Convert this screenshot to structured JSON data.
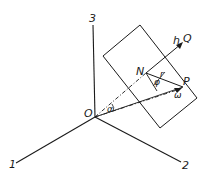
{
  "diagram": {
    "axes": [
      {
        "id": "axis-1",
        "label": "1"
      },
      {
        "id": "axis-2",
        "label": "2"
      },
      {
        "id": "axis-3",
        "label": "3"
      }
    ],
    "points": {
      "origin": "O",
      "N": "N",
      "P": "P",
      "Q": "Q"
    },
    "symbols": {
      "h": "h",
      "omega": "ω",
      "alpha": "α",
      "phi": "φ",
      "r": "r"
    },
    "colors": {
      "stroke": "#1a1a1a",
      "background": "#ffffff"
    }
  }
}
